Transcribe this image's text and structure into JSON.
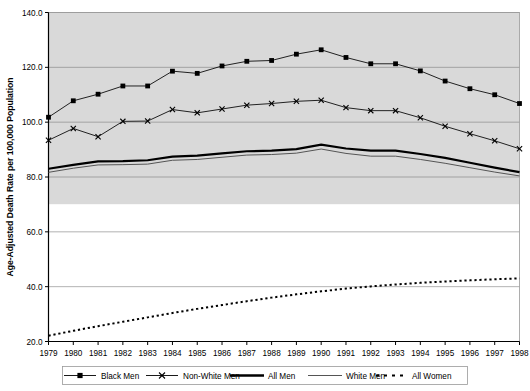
{
  "chart_data": {
    "type": "line",
    "title": "",
    "xlabel": "",
    "ylabel": "Age-Adjusted Death Rate per 100,000 Population",
    "x": [
      1979,
      1980,
      1981,
      1982,
      1983,
      1984,
      1985,
      1986,
      1987,
      1988,
      1989,
      1990,
      1991,
      1992,
      1993,
      1994,
      1995,
      1996,
      1997,
      1998
    ],
    "xtick_labels": [
      "1979",
      "1980",
      "1981",
      "1982",
      "1983",
      "1984",
      "1985",
      "1986",
      "1987",
      "1988",
      "1989",
      "1990",
      "1991",
      "1992",
      "1993",
      "1994",
      "1995",
      "1996",
      "1997",
      "1998"
    ],
    "ytick_labels": [
      "20.0",
      "40.0",
      "60.0",
      "80.0",
      "100.0",
      "120.0",
      "140.0"
    ],
    "yticks": [
      20,
      40,
      60,
      80,
      100,
      120,
      140
    ],
    "ylim": [
      20,
      140
    ],
    "xlim": [
      1979,
      1998
    ],
    "grid": true,
    "legend_position": "bottom",
    "series": [
      {
        "name": "Black Men",
        "marker": "square",
        "style": "solid-marker",
        "color": "#000000",
        "values": [
          101.8,
          107.8,
          110.2,
          113.2,
          113.2,
          118.6,
          117.8,
          120.5,
          122.2,
          122.5,
          124.8,
          126.4,
          123.6,
          121.3,
          121.3,
          118.7,
          115.0,
          112.2,
          110.0,
          106.8
        ]
      },
      {
        "name": "Non-White Men",
        "marker": "cross",
        "style": "thin-marker",
        "color": "#000000",
        "values": [
          93.4,
          97.7,
          94.7,
          100.3,
          100.4,
          104.6,
          103.4,
          104.8,
          106.2,
          106.8,
          107.6,
          108.0,
          105.3,
          104.2,
          104.2,
          101.6,
          98.5,
          95.8,
          93.2,
          90.3
        ]
      },
      {
        "name": "All Men",
        "marker": "none",
        "style": "thick-line",
        "color": "#000000",
        "values": [
          83.0,
          84.4,
          85.7,
          85.8,
          86.1,
          87.4,
          87.8,
          88.6,
          89.4,
          89.6,
          90.2,
          91.8,
          90.4,
          89.6,
          89.6,
          88.4,
          87.0,
          85.2,
          83.4,
          81.8
        ]
      },
      {
        "name": "White Men",
        "marker": "none",
        "style": "thin-line",
        "color": "#555555",
        "values": [
          81.7,
          83.2,
          84.4,
          84.5,
          84.7,
          86.1,
          86.4,
          87.2,
          88.0,
          88.2,
          88.7,
          90.2,
          88.6,
          87.6,
          87.6,
          86.4,
          85.0,
          83.4,
          81.8,
          80.4
        ]
      },
      {
        "name": "All Women",
        "marker": "none",
        "style": "dotted-line",
        "color": "#000000",
        "values": [
          22.1,
          23.9,
          25.6,
          27.2,
          28.8,
          30.4,
          31.9,
          33.3,
          34.7,
          36.0,
          37.2,
          38.3,
          39.3,
          40.1,
          40.8,
          41.4,
          41.9,
          42.3,
          42.7,
          43.0
        ]
      }
    ]
  },
  "legend": {
    "items": [
      {
        "label": "Black Men"
      },
      {
        "label": "Non-White Men"
      },
      {
        "label": "All Men"
      },
      {
        "label": "White Men"
      },
      {
        "label": "All Women"
      }
    ]
  },
  "colors": {
    "plot_background_upper": "#d9d9d9",
    "plot_background_lower": "#ffffff",
    "gridline": "#808080",
    "axis": "#000000"
  }
}
